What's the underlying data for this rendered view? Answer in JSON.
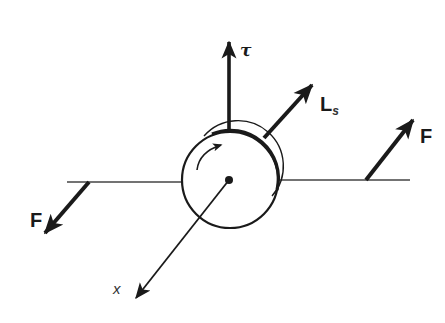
{
  "diagram": {
    "colors": {
      "ink": "#1a1a1a",
      "thin_line": "#444444",
      "background": "#ffffff"
    },
    "labels": {
      "torque": "τ",
      "spin_angular_momentum_main": "L",
      "spin_angular_momentum_sub": "s",
      "force_right": "F",
      "force_left": "F",
      "axis": "x"
    },
    "elements": {
      "wheel": {
        "center": [
          230,
          180
        ],
        "radius": 48
      },
      "axle_left": {
        "from": [
          67,
          182
        ],
        "to": [
          182,
          182
        ]
      },
      "axle_right": {
        "from": [
          278,
          180
        ],
        "to": [
          410,
          180
        ]
      },
      "torque_vector": {
        "from": [
          229,
          130
        ],
        "to": [
          229,
          40
        ]
      },
      "spin_vector": {
        "from": [
          264,
          138
        ],
        "to": [
          313,
          84
        ]
      },
      "force_right_vector": {
        "from": [
          366,
          180
        ],
        "to": [
          414,
          119
        ]
      },
      "force_left_vector": {
        "from": [
          90,
          182
        ],
        "to": [
          44,
          234
        ]
      },
      "x_axis": {
        "from": [
          229,
          180
        ],
        "to": [
          134,
          300
        ]
      },
      "rotation_arrow": "counterclockwise-to-clockwise arc indicating spin direction"
    }
  }
}
